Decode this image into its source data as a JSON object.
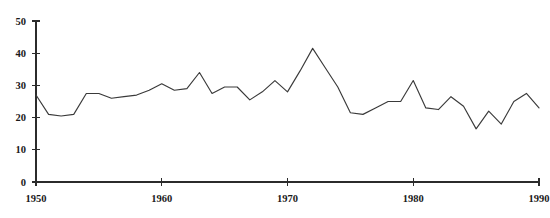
{
  "chart_data": {
    "type": "line",
    "title": "",
    "subtitle": "",
    "xlabel": "",
    "ylabel": "",
    "xlim": [
      1950,
      1990
    ],
    "ylim": [
      0,
      50
    ],
    "grid": false,
    "legend": "none",
    "x_ticks": [
      1950,
      1960,
      1970,
      1980,
      1990
    ],
    "x_tick_labels": [
      "1950",
      "1960",
      "1970",
      "1980",
      "1990"
    ],
    "y_ticks": [
      0,
      10,
      20,
      30,
      40,
      50
    ],
    "y_tick_labels": [
      "0",
      "10",
      "20",
      "30",
      "40",
      "50"
    ],
    "series": [
      {
        "name": "series-1",
        "color": "#3a3a3a",
        "x": [
          1950,
          1951,
          1952,
          1953,
          1954,
          1955,
          1956,
          1957,
          1958,
          1959,
          1960,
          1961,
          1962,
          1963,
          1964,
          1965,
          1966,
          1967,
          1968,
          1969,
          1970,
          1971,
          1972,
          1973,
          1974,
          1975,
          1976,
          1977,
          1978,
          1979,
          1980,
          1981,
          1982,
          1983,
          1984,
          1985,
          1986,
          1987,
          1988,
          1989,
          1990
        ],
        "values": [
          27,
          21,
          20.5,
          21,
          27.5,
          27.5,
          26,
          26.5,
          27,
          28.5,
          30.5,
          28.5,
          29,
          34,
          27.5,
          29.5,
          29.5,
          25.5,
          28,
          31.5,
          28,
          34.5,
          41.5,
          35.5,
          29.5,
          21.5,
          21,
          23,
          25,
          25,
          31.5,
          23,
          22.5,
          26.5,
          23.5,
          16.5,
          22,
          18,
          25,
          27.5,
          23
        ]
      }
    ]
  },
  "axes": {
    "x_axis_name": "year-axis",
    "y_axis_name": "value-axis"
  }
}
